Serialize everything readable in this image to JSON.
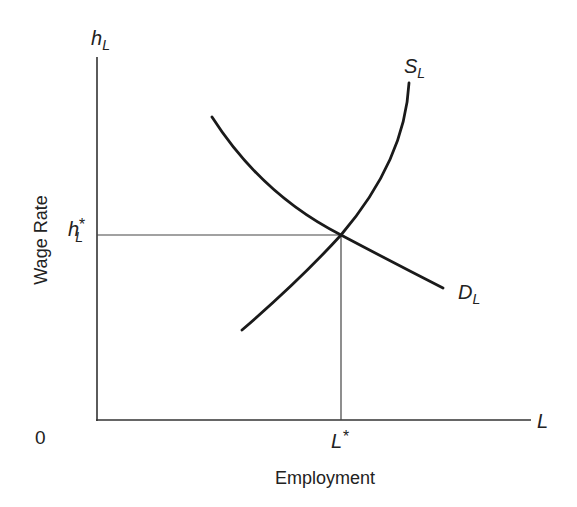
{
  "diagram": {
    "type": "labor-market-supply-demand",
    "y_axis": {
      "label": "h",
      "label_sub": "L",
      "title": "Wage Rate"
    },
    "x_axis": {
      "label": "L",
      "title": "Employment"
    },
    "origin_label": "0",
    "equilibrium": {
      "wage_label": "h",
      "wage_sub": "L",
      "wage_sup": "*",
      "quantity_label": "L",
      "quantity_sup": "*"
    },
    "curves": [
      {
        "name": "supply",
        "label": "S",
        "label_sub": "L",
        "slope": "upward"
      },
      {
        "name": "demand",
        "label": "D",
        "label_sub": "L",
        "slope": "downward"
      }
    ],
    "colors": {
      "curve": "#1a1a1a",
      "axis": "#333333",
      "guide": "#444444"
    }
  }
}
